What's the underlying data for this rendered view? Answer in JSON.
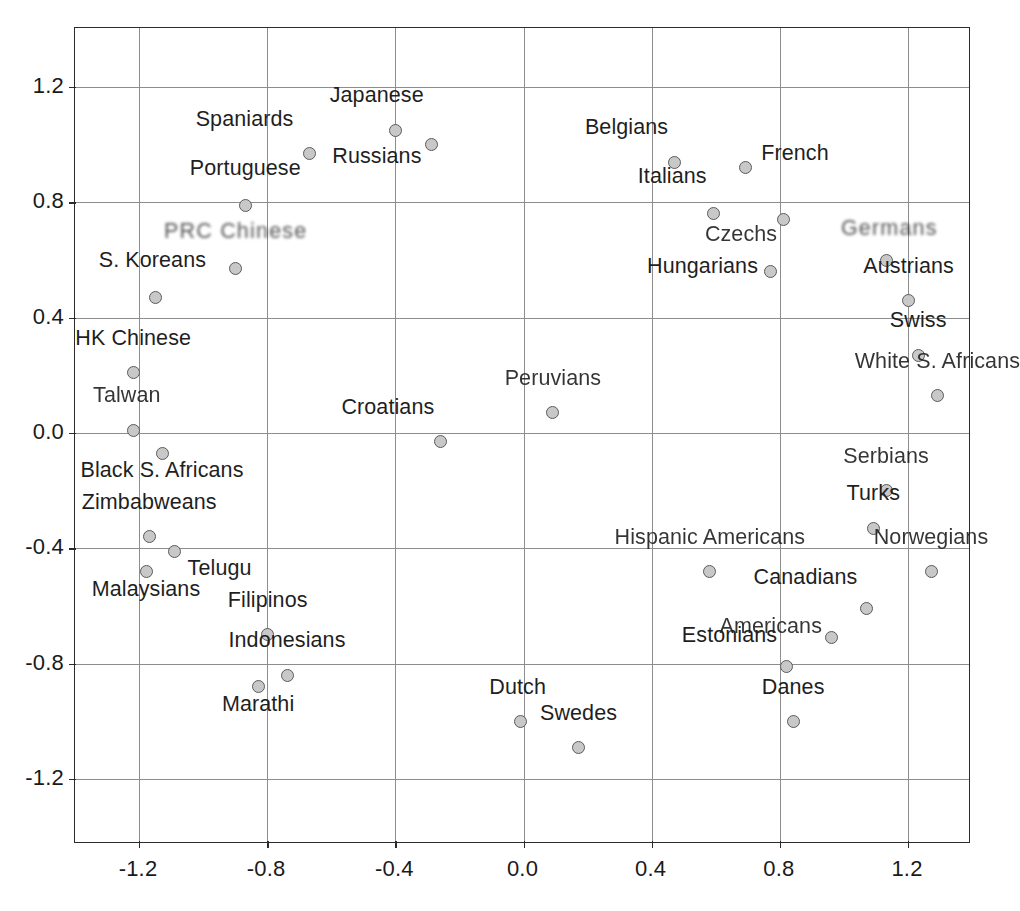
{
  "chart_data": {
    "type": "scatter",
    "title": "",
    "subtitle": "",
    "xlabel": "",
    "ylabel": "",
    "xlim": [
      -1.4,
      1.35
    ],
    "ylim": [
      -1.43,
      1.38
    ],
    "xticks": [
      "-1.2",
      "-0.8",
      "-0.4",
      "0.0",
      "0.4",
      "0.8",
      "1.2"
    ],
    "xtick_values": [
      -1.2,
      -0.8,
      -0.4,
      0.0,
      0.4,
      0.8,
      1.2
    ],
    "yticks": [
      "1.2",
      "0.8",
      "0.4",
      "0.0",
      "-0.4",
      "-0.8",
      "-1.2"
    ],
    "ytick_values": [
      1.2,
      0.8,
      0.4,
      0.0,
      -0.4,
      -0.8,
      -1.2
    ],
    "grid": true,
    "legend": "none",
    "marker_fill": "#c8c8c8",
    "marker_edge": "#5b5b5b",
    "grid_color": "#8d8d8d",
    "axis_color": "#2b2b2b",
    "points": [
      {
        "label": "Japanese",
        "x": 0.73,
        "y": 1.05,
        "lx": -0.06,
        "ly": 0.1,
        "anchor": "center"
      },
      {
        "label": "Spaniards",
        "x": 0.46,
        "y": 0.97,
        "lx": -0.05,
        "ly": 0.1,
        "anchor": "end"
      },
      {
        "label": "Russians",
        "x": 0.84,
        "y": 1.0,
        "lx": -0.03,
        "ly": -0.06,
        "anchor": "end"
      },
      {
        "label": "Belgians",
        "x": 1.6,
        "y": 0.94,
        "lx": -0.02,
        "ly": 0.1,
        "anchor": "end"
      },
      {
        "label": "French",
        "x": 1.82,
        "y": 0.92,
        "lx": 0.05,
        "ly": 0.03,
        "anchor": "start"
      },
      {
        "label": "Portuguese",
        "x": 0.26,
        "y": 0.79,
        "lx": 0.0,
        "ly": 0.11,
        "anchor": "center"
      },
      {
        "label": "Italians",
        "x": 1.72,
        "y": 0.76,
        "lx": -0.02,
        "ly": 0.11,
        "anchor": "end"
      },
      {
        "label": "Czechs",
        "x": 1.94,
        "y": 0.74,
        "lx": -0.02,
        "ly": -0.07,
        "anchor": "end"
      },
      {
        "label": "Germans",
        "x": 2.26,
        "y": 0.6,
        "lx": 0.01,
        "ly": 0.09,
        "anchor": "center"
      },
      {
        "label": "PRC Chinese",
        "x": 0.23,
        "y": 0.57,
        "lx": 0.0,
        "ly": 0.11,
        "anchor": "center"
      },
      {
        "label": "Hungarians",
        "x": 1.9,
        "y": 0.56,
        "lx": -0.04,
        "ly": 0.0,
        "anchor": "end"
      },
      {
        "label": "Austrians",
        "x": 2.33,
        "y": 0.46,
        "lx": 0.0,
        "ly": 0.1,
        "anchor": "center"
      },
      {
        "label": "S. Koreans",
        "x": -0.02,
        "y": 0.47,
        "lx": -0.01,
        "ly": 0.11,
        "anchor": "center"
      },
      {
        "label": "Swiss",
        "x": 2.36,
        "y": 0.27,
        "lx": 0.0,
        "ly": 0.1,
        "anchor": "center"
      },
      {
        "label": "HK Chinese",
        "x": -0.09,
        "y": 0.21,
        "lx": 0.0,
        "ly": 0.1,
        "anchor": "center"
      },
      {
        "label": "White S. Africans",
        "x": 2.42,
        "y": 0.13,
        "lx": 0.0,
        "ly": 0.1,
        "anchor": "center"
      },
      {
        "label": "Peruvians",
        "x": 1.22,
        "y": 0.07,
        "lx": 0.0,
        "ly": 0.1,
        "anchor": "center"
      },
      {
        "label": "Talwan",
        "x": -0.09,
        "y": 0.01,
        "lx": -0.02,
        "ly": 0.1,
        "anchor": "center"
      },
      {
        "label": "Croatians",
        "x": 0.87,
        "y": -0.03,
        "lx": -0.02,
        "ly": 0.1,
        "anchor": "end"
      },
      {
        "label": "Black S. Africans",
        "x": 0.0,
        "y": -0.07,
        "lx": 0.0,
        "ly": -0.08,
        "anchor": "center"
      },
      {
        "label": "Serbians",
        "x": 2.26,
        "y": -0.2,
        "lx": 0.0,
        "ly": 0.1,
        "anchor": "center"
      },
      {
        "label": "Turks",
        "x": 2.22,
        "y": -0.33,
        "lx": 0.0,
        "ly": 0.1,
        "anchor": "center"
      },
      {
        "label": "Zimbabweans",
        "x": -0.04,
        "y": -0.36,
        "lx": 0.0,
        "ly": 0.1,
        "anchor": "center"
      },
      {
        "label": "Telugu",
        "x": 0.04,
        "y": -0.41,
        "lx": 0.04,
        "ly": -0.08,
        "anchor": "start"
      },
      {
        "label": "Hispanic Americans",
        "x": 1.71,
        "y": -0.48,
        "lx": 0.0,
        "ly": 0.1,
        "anchor": "center"
      },
      {
        "label": "Norwegians",
        "x": 2.4,
        "y": -0.48,
        "lx": 0.0,
        "ly": 0.1,
        "anchor": "center"
      },
      {
        "label": "Malaysians",
        "x": -0.05,
        "y": -0.48,
        "lx": 0.0,
        "ly": -0.08,
        "anchor": "center"
      },
      {
        "label": "Canadians",
        "x": 2.2,
        "y": -0.61,
        "lx": -0.03,
        "ly": 0.09,
        "anchor": "end"
      },
      {
        "label": "Filipinos",
        "x": 0.33,
        "y": -0.7,
        "lx": 0.0,
        "ly": 0.1,
        "anchor": "center"
      },
      {
        "label": "Americans",
        "x": 2.09,
        "y": -0.71,
        "lx": -0.03,
        "ly": 0.02,
        "anchor": "end"
      },
      {
        "label": "Estonians",
        "x": 1.95,
        "y": -0.81,
        "lx": -0.03,
        "ly": 0.09,
        "anchor": "end"
      },
      {
        "label": "Indonesians",
        "x": 0.39,
        "y": -0.84,
        "lx": 0.0,
        "ly": 0.1,
        "anchor": "center"
      },
      {
        "label": "Marathi",
        "x": 0.3,
        "y": -0.88,
        "lx": 0.0,
        "ly": -0.08,
        "anchor": "center"
      },
      {
        "label": "Danes",
        "x": 1.97,
        "y": -1.0,
        "lx": 0.0,
        "ly": 0.1,
        "anchor": "center"
      },
      {
        "label": "Dutch",
        "x": 1.12,
        "y": -1.0,
        "lx": -0.01,
        "ly": 0.1,
        "anchor": "center"
      },
      {
        "label": "Swedes",
        "x": 1.3,
        "y": -1.09,
        "lx": 0.0,
        "ly": 0.1,
        "anchor": "center"
      }
    ]
  }
}
